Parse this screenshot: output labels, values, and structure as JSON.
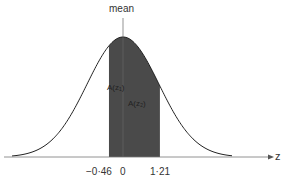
{
  "chart_data": {
    "type": "area",
    "title": "",
    "xlabel": "z",
    "ylabel": "",
    "mean_label": "mean",
    "x_ticks": [
      "−0.46",
      "0",
      "1.21"
    ],
    "shaded_interval": [
      -0.46,
      1.21
    ],
    "area_labels": [
      "A(z₁)",
      "A(z₂)"
    ],
    "grid": false,
    "legend": "none"
  },
  "labels": {
    "mean": "mean",
    "axis": "z",
    "tick_left": "−0·46",
    "tick_zero": "0",
    "tick_right": "1·21",
    "area1": "A(z₁)",
    "area2": "A(z₂)"
  },
  "colors": {
    "shade": "#4a4a4a",
    "curve": "#222222",
    "axis": "#666666"
  }
}
